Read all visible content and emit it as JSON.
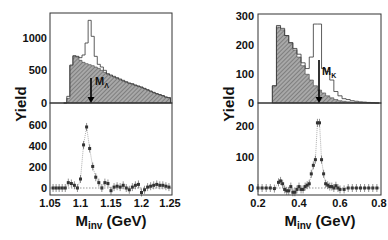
{
  "chart_data": [
    {
      "panel": "left",
      "type": "bar",
      "subplots": [
        {
          "name": "upper",
          "type": "histogram",
          "ylabel": "Yield",
          "ylim": [
            0,
            1350
          ],
          "yticks": [
            0,
            500,
            1000
          ],
          "x": [
            1.075,
            1.08,
            1.085,
            1.09,
            1.095,
            1.1,
            1.105,
            1.11,
            1.115,
            1.12,
            1.125,
            1.13,
            1.135,
            1.14,
            1.145,
            1.15,
            1.155,
            1.16,
            1.165,
            1.17,
            1.175,
            1.18,
            1.185,
            1.19,
            1.195,
            1.2,
            1.205,
            1.21,
            1.215,
            1.22,
            1.225,
            1.23,
            1.235,
            1.24,
            1.245
          ],
          "series": [
            {
              "name": "same-event (open histogram)",
              "values": [
                0,
                100,
                570,
                710,
                700,
                680,
                720,
                900,
                1240,
                1000,
                700,
                580,
                540,
                490,
                440,
                420,
                400,
                380,
                360,
                340,
                320,
                300,
                290,
                270,
                255,
                240,
                220,
                200,
                180,
                160,
                140,
                125,
                110,
                90,
                80
              ]
            },
            {
              "name": "mixed-event background (hatched)",
              "values": [
                0,
                70,
                560,
                700,
                690,
                640,
                610,
                590,
                575,
                560,
                540,
                520,
                490,
                460,
                430,
                410,
                390,
                370,
                350,
                330,
                310,
                295,
                280,
                265,
                250,
                235,
                215,
                195,
                175,
                155,
                140,
                125,
                110,
                90,
                80
              ]
            }
          ],
          "annotation": {
            "text": "M_Λ",
            "x": 1.116
          }
        },
        {
          "name": "lower",
          "type": "scatter",
          "ylabel": "Yield",
          "ylim": [
            -60,
            780
          ],
          "yticks": [
            0,
            200,
            400,
            600
          ],
          "x": [
            1.055,
            1.06,
            1.065,
            1.07,
            1.075,
            1.08,
            1.085,
            1.09,
            1.095,
            1.1,
            1.105,
            1.11,
            1.115,
            1.12,
            1.125,
            1.13,
            1.135,
            1.14,
            1.145,
            1.15,
            1.155,
            1.16,
            1.165,
            1.17,
            1.175,
            1.18,
            1.185,
            1.19,
            1.195,
            1.2,
            1.205,
            1.21,
            1.215,
            1.22,
            1.225,
            1.23,
            1.235,
            1.24,
            1.245
          ],
          "values": [
            0,
            0,
            0,
            0,
            0,
            60,
            50,
            30,
            0,
            100,
            480,
            680,
            440,
            240,
            120,
            60,
            0,
            60,
            50,
            -30,
            10,
            20,
            10,
            30,
            0,
            -20,
            10,
            30,
            40,
            -50,
            -20,
            10,
            20,
            30,
            40,
            30,
            30,
            20,
            10
          ],
          "fit": "gaussian",
          "xlabel": "M_inv (GeV)",
          "xticks": [
            1.05,
            1.1,
            1.15,
            1.2,
            1.25
          ],
          "xlim": [
            1.05,
            1.25
          ]
        }
      ]
    },
    {
      "panel": "right",
      "type": "bar",
      "subplots": [
        {
          "name": "upper",
          "type": "histogram",
          "ylabel": "Yield",
          "ylim": [
            0,
            310
          ],
          "yticks": [
            0,
            100,
            200,
            300
          ],
          "x": [
            0.28,
            0.3,
            0.32,
            0.34,
            0.36,
            0.38,
            0.4,
            0.42,
            0.44,
            0.46,
            0.48,
            0.5,
            0.52,
            0.54,
            0.56,
            0.58,
            0.6,
            0.62,
            0.64,
            0.66,
            0.68,
            0.7,
            0.72,
            0.74,
            0.76,
            0.78
          ],
          "series": [
            {
              "name": "same-event (open histogram)",
              "values": [
                60,
                270,
                260,
                235,
                210,
                190,
                170,
                140,
                120,
                160,
                275,
                275,
                120,
                110,
                80,
                40,
                25,
                15,
                12,
                8,
                6,
                4,
                3,
                2,
                1,
                0
              ]
            },
            {
              "name": "mixed-event background (hatched)",
              "values": [
                60,
                265,
                255,
                235,
                210,
                185,
                160,
                130,
                100,
                80,
                60,
                45,
                35,
                25,
                18,
                12,
                8,
                6,
                4,
                3,
                2,
                1,
                1,
                0,
                0,
                0
              ]
            }
          ],
          "annotation": {
            "text": "M_K",
            "x": 0.5
          }
        },
        {
          "name": "lower",
          "type": "scatter",
          "ylabel": "Yield",
          "ylim": [
            -30,
            300
          ],
          "yticks": [
            0,
            100,
            200
          ],
          "x": [
            0.2,
            0.22,
            0.24,
            0.26,
            0.28,
            0.3,
            0.31,
            0.32,
            0.33,
            0.34,
            0.35,
            0.36,
            0.37,
            0.38,
            0.39,
            0.4,
            0.41,
            0.42,
            0.43,
            0.44,
            0.45,
            0.46,
            0.47,
            0.48,
            0.49,
            0.5,
            0.51,
            0.52,
            0.53,
            0.54,
            0.55,
            0.56,
            0.57,
            0.58,
            0.59,
            0.6,
            0.62,
            0.64,
            0.66,
            0.68,
            0.7,
            0.72,
            0.74,
            0.76,
            0.78
          ],
          "values": [
            0,
            0,
            0,
            0,
            -2,
            20,
            25,
            15,
            -5,
            -10,
            -10,
            5,
            -15,
            -15,
            -5,
            5,
            -5,
            -5,
            5,
            10,
            15,
            50,
            80,
            100,
            230,
            230,
            100,
            50,
            15,
            10,
            5,
            5,
            0,
            8,
            0,
            -5,
            -5,
            0,
            0,
            0,
            0,
            0,
            0,
            0,
            0
          ],
          "fit": "gaussian",
          "xlabel": "M_inv (GeV)",
          "xticks": [
            0.2,
            0.4,
            0.6,
            0.8
          ],
          "xlim": [
            0.2,
            0.8
          ]
        }
      ]
    }
  ],
  "labels": {
    "ylabel": "Yield",
    "xlabel_main": "M",
    "xlabel_sub": "inv",
    "xlabel_unit": " (GeV)",
    "left_annotation_main": "M",
    "left_annotation_sub": "Λ",
    "right_annotation_main": "M",
    "right_annotation_sub": "K"
  },
  "left_ticks": {
    "upper_y": [
      "1000",
      "500",
      "0"
    ],
    "lower_y": [
      "600",
      "400",
      "200",
      "0"
    ],
    "x": [
      "1.05",
      "1.1",
      "1.15",
      "1.2",
      "1.25"
    ]
  },
  "right_ticks": {
    "upper_y": [
      "300",
      "200",
      "100",
      "0"
    ],
    "lower_y": [
      "200",
      "100",
      "0"
    ],
    "x": [
      "0.2",
      "0.4",
      "0.6",
      "0.8"
    ]
  }
}
